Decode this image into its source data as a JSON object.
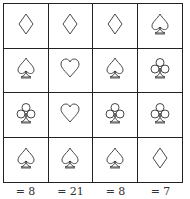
{
  "grid": {
    "rows": [
      [
        "diamond",
        "diamond",
        "diamond",
        "spade"
      ],
      [
        "spade",
        "heart",
        "spade",
        "club"
      ],
      [
        "club",
        "heart",
        "club",
        "club"
      ],
      [
        "spade",
        "spade",
        "spade",
        "diamond"
      ]
    ]
  },
  "column_sums": [
    "= 8",
    "= 21",
    "= 8",
    "= 7"
  ]
}
